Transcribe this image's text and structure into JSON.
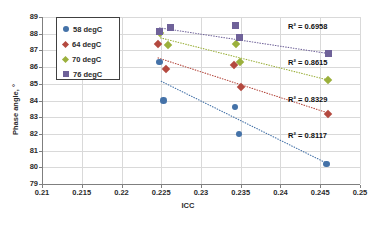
{
  "chart_data": {
    "type": "scatter",
    "title": "",
    "xlabel": "ICC",
    "ylabel": "Phase angle, °",
    "xlim": [
      0.21,
      0.25
    ],
    "ylim": [
      79,
      89
    ],
    "xticks": [
      "0.21",
      "0.215",
      "0.22",
      "0.225",
      "0.23",
      "0.235",
      "0.24",
      "0.245",
      "0.25"
    ],
    "xtick_values": [
      0.21,
      0.215,
      0.22,
      0.225,
      0.23,
      0.235,
      0.24,
      0.245,
      0.25
    ],
    "yticks": [
      "79",
      "80",
      "81",
      "82",
      "83",
      "84",
      "85",
      "86",
      "87",
      "88",
      "89"
    ],
    "ytick_values": [
      79,
      80,
      81,
      82,
      83,
      84,
      85,
      86,
      87,
      88,
      89
    ],
    "grid": true,
    "legend_position": "upper-left-inside",
    "series": [
      {
        "name": "58 degC",
        "color": "#4472a8",
        "marker": "circle",
        "r2_label": "R² = 0.8117",
        "r2": 0.8117,
        "points": [
          {
            "x": 0.2248,
            "y": 86.3
          },
          {
            "x": 0.2253,
            "y": 84.0
          },
          {
            "x": 0.2343,
            "y": 83.6
          },
          {
            "x": 0.2348,
            "y": 82.0
          },
          {
            "x": 0.2458,
            "y": 80.2
          }
        ],
        "trend": {
          "x1": 0.225,
          "y1": 85.15,
          "x2": 0.246,
          "y2": 80.2
        }
      },
      {
        "name": "64 degC",
        "color": "#b4493f",
        "marker": "diamond",
        "r2_label": "R² = 0.8329",
        "r2": 0.8329,
        "points": [
          {
            "x": 0.2246,
            "y": 87.4
          },
          {
            "x": 0.2256,
            "y": 85.9
          },
          {
            "x": 0.2342,
            "y": 86.1
          },
          {
            "x": 0.235,
            "y": 84.8
          },
          {
            "x": 0.246,
            "y": 83.2
          }
        ],
        "trend": {
          "x1": 0.2246,
          "y1": 86.55,
          "x2": 0.246,
          "y2": 83.25
        }
      },
      {
        "name": "70 degC",
        "color": "#9bb03c",
        "marker": "diamond",
        "r2_label": "R² = 0.8615",
        "r2": 0.8615,
        "points": [
          {
            "x": 0.2249,
            "y": 88.05
          },
          {
            "x": 0.2258,
            "y": 87.35
          },
          {
            "x": 0.2344,
            "y": 87.4
          },
          {
            "x": 0.2349,
            "y": 86.3
          },
          {
            "x": 0.246,
            "y": 85.2
          }
        ],
        "trend": {
          "x1": 0.2249,
          "y1": 87.75,
          "x2": 0.2462,
          "y2": 85.2
        }
      },
      {
        "name": "76 degC",
        "color": "#6f6299",
        "marker": "square",
        "r2_label": "R² = 0.6958",
        "r2": 0.6958,
        "points": [
          {
            "x": 0.2248,
            "y": 88.15
          },
          {
            "x": 0.2262,
            "y": 88.4
          },
          {
            "x": 0.2344,
            "y": 88.5
          },
          {
            "x": 0.2349,
            "y": 87.8
          },
          {
            "x": 0.2461,
            "y": 86.8
          }
        ],
        "trend": {
          "x1": 0.2248,
          "y1": 88.35,
          "x2": 0.2462,
          "y2": 86.8
        }
      }
    ]
  },
  "legend": {
    "items": [
      {
        "label": "58 degC",
        "color": "#4472a8",
        "marker": "circle"
      },
      {
        "label": "64 degC",
        "color": "#b4493f",
        "marker": "diamond"
      },
      {
        "label": "70 degC",
        "color": "#9bb03c",
        "marker": "diamond"
      },
      {
        "label": "76 degC",
        "color": "#6f6299",
        "marker": "square"
      }
    ]
  }
}
